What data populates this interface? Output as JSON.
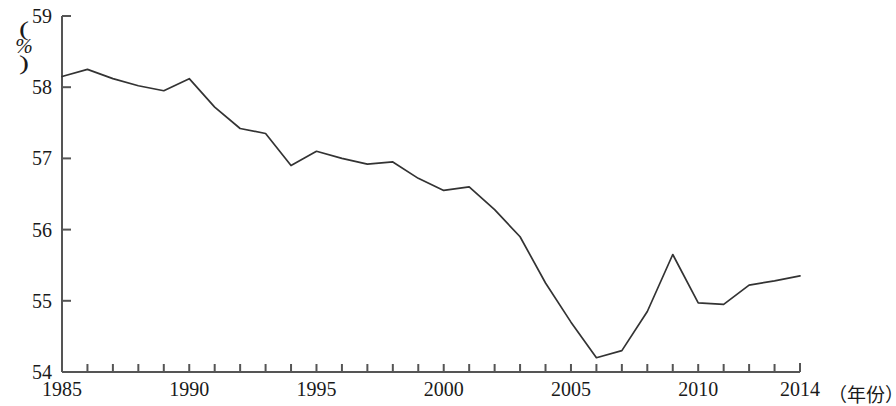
{
  "chart_data": {
    "type": "line",
    "title": "",
    "xlabel": "（年份）",
    "ylabel": "（%）",
    "ylabel_unit": "%",
    "paren_open": "(",
    "paren_close": ")",
    "x": [
      1985,
      1986,
      1987,
      1988,
      1989,
      1990,
      1991,
      1992,
      1993,
      1994,
      1995,
      1996,
      1997,
      1998,
      1999,
      2000,
      2001,
      2002,
      2003,
      2004,
      2005,
      2006,
      2007,
      2008,
      2009,
      2010,
      2011,
      2012,
      2013,
      2014
    ],
    "values": [
      58.15,
      58.25,
      58.12,
      58.02,
      57.95,
      58.12,
      57.72,
      57.42,
      57.35,
      56.9,
      57.1,
      57.0,
      56.92,
      56.95,
      56.72,
      56.55,
      56.6,
      56.28,
      55.9,
      55.25,
      54.7,
      54.2,
      54.3,
      54.85,
      55.65,
      54.97,
      54.95,
      55.22,
      55.28,
      55.35
    ],
    "xlim": [
      1985,
      2014
    ],
    "ylim": [
      54,
      59
    ],
    "y_ticks": [
      "54",
      "55",
      "56",
      "57",
      "58",
      "59"
    ],
    "x_ticks_major": [
      "1985",
      "1990",
      "1995",
      "2000",
      "2005",
      "2010",
      "2014"
    ],
    "x_ticks_major_values": [
      1985,
      1990,
      1995,
      2000,
      2005,
      2010,
      2014
    ],
    "grid": false,
    "legend": "none",
    "line_color": "#333333",
    "axis_color": "#555555"
  }
}
